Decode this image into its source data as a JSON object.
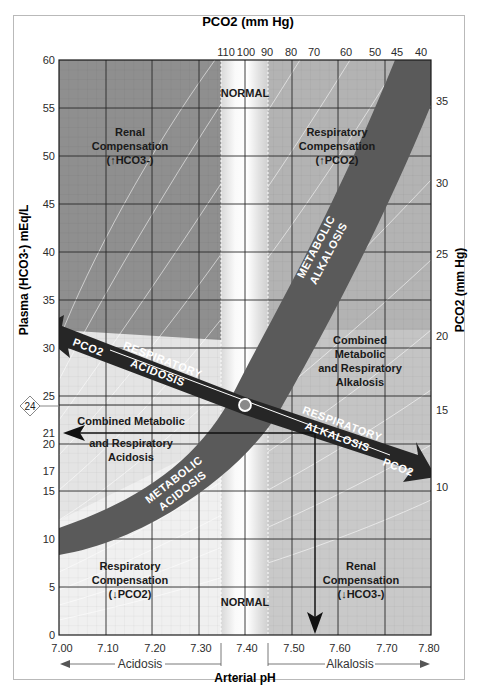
{
  "diagram": {
    "title_top_axis": "PCO2 (mm Hg)",
    "left_axis_label": "Plasma (HCO3-) mEq/L",
    "right_axis_label": "PCO2 (mm Hg)",
    "bottom_axis_label": "Arterial pH",
    "colors": {
      "dark_region": "#8d8d8d",
      "light_region": "#e6e6e6",
      "alkalosis_region": "#c2c2c2",
      "metabolic_band": "#5a5a5a",
      "respiratory_arrow": "#262626",
      "normal_band": "#f4f4f4",
      "grid_major": "#2a2a2a",
      "normal_point": "#8a8a8a"
    },
    "x_axis": {
      "ticks": [
        "7.00",
        "7.10",
        "7.20",
        "7.30",
        "7.40",
        "7.50",
        "7.60",
        "7.70",
        "7.80"
      ],
      "acidosis_label": "Acidosis",
      "alkalosis_label": "Alkalosis"
    },
    "y_axis_left": {
      "ticks": [
        "0",
        "5",
        "10",
        "15",
        "17",
        "20",
        "21",
        "25",
        "30",
        "35",
        "40",
        "45",
        "50",
        "55",
        "60"
      ],
      "marker_value": "24"
    },
    "top_axis": {
      "ticks": [
        "110",
        "100",
        "90",
        "80",
        "70",
        "60",
        "50",
        "45",
        "40"
      ]
    },
    "right_axis": {
      "ticks": [
        "35",
        "30",
        "25",
        "20",
        "15",
        "10"
      ]
    },
    "regions": {
      "renal_comp_up": {
        "line1": "Renal",
        "line2": "Compensation",
        "line3": "(↑HCO3-)"
      },
      "resp_comp_up": {
        "line1": "Respiratory",
        "line2": "Compensation",
        "line3": "(↑PCO2)"
      },
      "normal_top": "NORMAL",
      "normal_bottom": "NORMAL",
      "metabolic_alkalosis": {
        "line1": "METABOLIC",
        "line2": "ALKALOSIS"
      },
      "metabolic_acidosis": {
        "line1": "METABOLIC",
        "line2": "ACIDOSIS"
      },
      "respiratory_acidosis": {
        "line1": "RESPIRATORY",
        "line2": "ACIDOSIS",
        "end": "PCO2"
      },
      "respiratory_alkalosis": {
        "line1": "RESPIRATORY",
        "line2": "ALKALOSIS",
        "end": "PCO2"
      },
      "combined_alkalosis": {
        "line1": "Combined",
        "line2": "Metabolic",
        "line3": "and Respiratory",
        "line4": "Alkalosis"
      },
      "combined_acidosis": {
        "line1": "Combined Metabolic",
        "line2": "and Respiratory",
        "line3": "Acidosis"
      },
      "resp_comp_down": {
        "line1": "Respiratory",
        "line2": "Compensation",
        "line3": "(↓PCO2)"
      },
      "renal_comp_down": {
        "line1": "Renal",
        "line2": "Compensation",
        "line3": "(↓HCO3-)"
      }
    }
  }
}
